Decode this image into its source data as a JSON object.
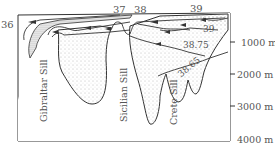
{
  "diagram": {
    "type": "oceanographic cross-section",
    "top_labels": [
      "36",
      "37",
      "38",
      "39"
    ],
    "contour_labels": [
      "39",
      "38.75",
      "38.65"
    ],
    "sill_labels": [
      "Gibraltar Sill",
      "Sicilian Sill",
      "Crete Sill"
    ],
    "depth_axis": {
      "ticks": [
        "1000 m",
        "2000 m",
        "3000 m",
        "4000 m"
      ]
    }
  }
}
